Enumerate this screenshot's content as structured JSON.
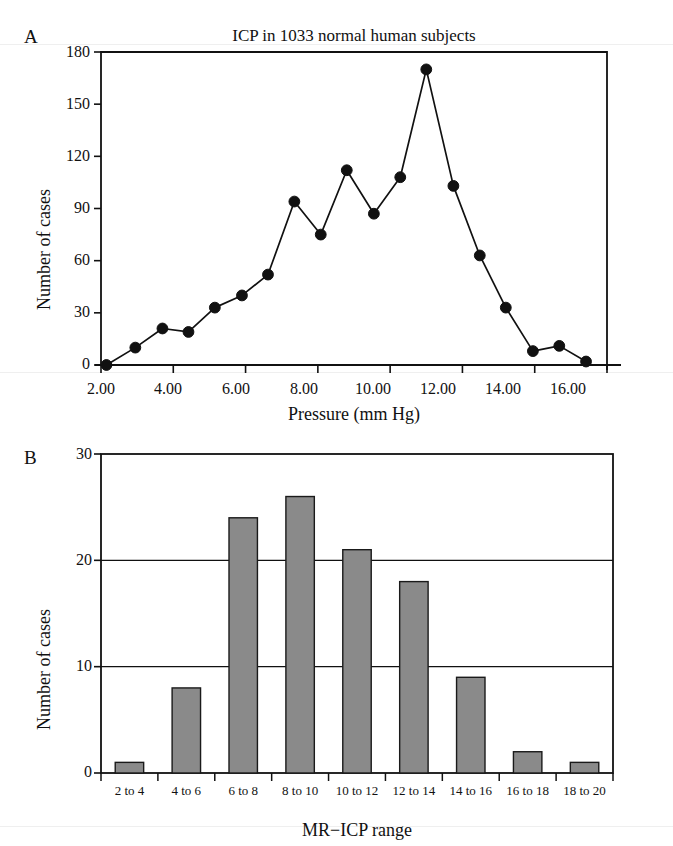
{
  "figure": {
    "background": "#ffffff",
    "ink": "#111111",
    "bar_fill": "#8a8a8a",
    "bar_stroke": "#1a1a1a"
  },
  "panels": [
    {
      "letter": "A",
      "title": "ICP in 1033 normal human subjects",
      "xlabel": "Pressure (mm Hg)",
      "ylabel": "Number of cases"
    },
    {
      "letter": "B",
      "title": "",
      "xlabel": "MR−ICP range",
      "ylabel": "Number of cases"
    }
  ],
  "chart_data": [
    {
      "type": "line",
      "panel": "A",
      "title": "ICP in 1033 normal human subjects",
      "xlabel": "Pressure (mm Hg)",
      "ylabel": "Number of cases",
      "xlim": [
        2.0,
        16.0
      ],
      "ylim": [
        0,
        180
      ],
      "xticks": [
        2.0,
        4.0,
        6.0,
        8.0,
        10.0,
        12.0,
        14.0,
        16.0
      ],
      "xtick_labels": [
        "2.00",
        "4.00",
        "6.00",
        "8.00",
        "10.00",
        "12.00",
        "14.00",
        "16.00"
      ],
      "yticks": [
        0,
        30,
        60,
        90,
        120,
        150,
        180
      ],
      "ytick_labels": [
        "0",
        "30",
        "60",
        "90",
        "120",
        "150",
        "180"
      ],
      "grid": false,
      "legend": "none",
      "marker": "filled-circle",
      "x": [
        2.15,
        2.95,
        3.7,
        4.42,
        5.15,
        5.9,
        6.62,
        7.35,
        8.08,
        8.8,
        9.55,
        10.28,
        11.0,
        11.75,
        12.48,
        13.2,
        13.95,
        14.68,
        15.42
      ],
      "y": [
        0,
        10,
        21,
        19,
        33,
        40,
        52,
        94,
        75,
        112,
        87,
        108,
        170,
        103,
        63,
        33,
        8,
        11,
        2
      ]
    },
    {
      "type": "bar",
      "panel": "B",
      "title": "",
      "xlabel": "MR−ICP range",
      "ylabel": "Number of cases",
      "ylim": [
        0,
        30
      ],
      "yticks": [
        0,
        10,
        20,
        30
      ],
      "ytick_labels": [
        "0",
        "10",
        "20",
        "30"
      ],
      "grid": true,
      "legend": "none",
      "categories": [
        "2 to 4",
        "4 to 6",
        "6 to 8",
        "8 to 10",
        "10 to 12",
        "12 to 14",
        "14 to 16",
        "16 to 18",
        "18 to 20"
      ],
      "values": [
        1,
        8,
        24,
        26,
        21,
        18,
        9,
        2,
        1
      ]
    }
  ]
}
